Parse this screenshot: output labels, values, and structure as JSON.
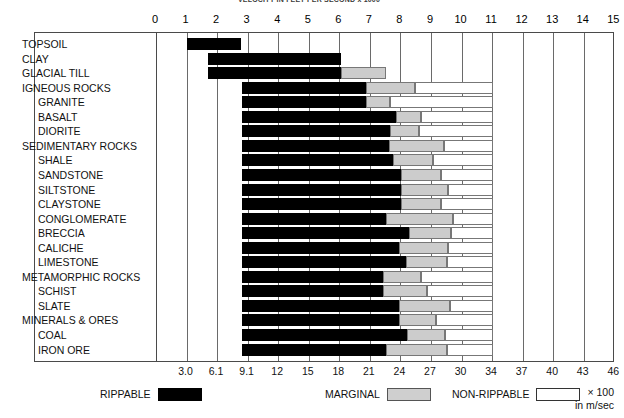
{
  "chart": {
    "title": "VELOCITY IN FEET PER SECOND x 1000",
    "top_axis": {
      "ticks": [
        "0",
        "1",
        "2",
        "3",
        "4",
        "5",
        "6",
        "7",
        "8",
        "9",
        "10",
        "11",
        "12",
        "13",
        "14",
        "15"
      ]
    },
    "bottom_axis": {
      "ticks": [
        "3.0",
        "6.1",
        "9.1",
        "12",
        "15",
        "18",
        "21",
        "24",
        "27",
        "30",
        "34",
        "37",
        "40",
        "43",
        "46"
      ]
    },
    "units": {
      "line1": "× 100",
      "line2": "in m/sec"
    }
  },
  "legend": {
    "items": [
      {
        "label": "RIPPABLE",
        "swatch": "rip"
      },
      {
        "label": "MARGINAL",
        "swatch": "mar"
      },
      {
        "label": "NON-RIPPABLE",
        "swatch": "non"
      }
    ]
  },
  "chart_data": {
    "type": "bar",
    "title": "VELOCITY IN FEET PER SECOND x 1000",
    "xlabel": "Velocity (ft/sec × 1000) / (m/sec × 100)",
    "ylabel": "",
    "xlim": [
      0,
      15
    ],
    "grid": true,
    "legend_position": "bottom",
    "series": [
      {
        "name": "RIPPABLE",
        "color": "#000000"
      },
      {
        "name": "MARGINAL",
        "color": "#cccccc"
      },
      {
        "name": "NON-RIPPABLE",
        "color": "#ffffff"
      }
    ],
    "categories": [
      "TOPSOIL",
      "CLAY",
      "GLACIAL TILL",
      "IGNEOUS ROCKS",
      "GRANITE",
      "BASALT",
      "DIORITE",
      "SEDIMENTARY ROCKS",
      "SHALE",
      "SANDSTONE",
      "SILTSTONE",
      "CLAYSTONE",
      "CONGLOMERATE",
      "BRECCIA",
      "CALICHE",
      "LIMESTONE",
      "METAMORPHIC ROCKS",
      "SCHIST",
      "SLATE",
      "MINERALS & ORES",
      "COAL",
      "IRON ORE"
    ],
    "rows": [
      {
        "label": "TOPSOIL",
        "indent": 0,
        "start": 1.05,
        "rippable_end": 2.8,
        "marginal_end": 2.8,
        "nonrippable_end": 2.8
      },
      {
        "label": "CLAY",
        "indent": 0,
        "start": 1.75,
        "rippable_end": 6.1,
        "marginal_end": 6.1,
        "nonrippable_end": 6.1
      },
      {
        "label": "GLACIAL TILL",
        "indent": 0,
        "start": 1.75,
        "rippable_end": 6.1,
        "marginal_end": 7.55,
        "nonrippable_end": 7.55
      },
      {
        "label": "IGNEOUS ROCKS",
        "indent": 0,
        "start": 2.85,
        "rippable_end": 6.9,
        "marginal_end": 8.5,
        "nonrippable_end": 11.05
      },
      {
        "label": "GRANITE",
        "indent": 1,
        "start": 2.85,
        "rippable_end": 6.9,
        "marginal_end": 7.7,
        "nonrippable_end": 11.05
      },
      {
        "label": "BASALT",
        "indent": 1,
        "start": 2.85,
        "rippable_end": 7.9,
        "marginal_end": 8.7,
        "nonrippable_end": 11.05
      },
      {
        "label": "DIORITE",
        "indent": 1,
        "start": 2.85,
        "rippable_end": 7.7,
        "marginal_end": 8.65,
        "nonrippable_end": 11.05
      },
      {
        "label": "SEDIMENTARY ROCKS",
        "indent": 0,
        "start": 2.85,
        "rippable_end": 7.65,
        "marginal_end": 9.45,
        "nonrippable_end": 11.05
      },
      {
        "label": "SHALE",
        "indent": 1,
        "start": 2.85,
        "rippable_end": 7.8,
        "marginal_end": 9.1,
        "nonrippable_end": 11.05
      },
      {
        "label": "SANDSTONE",
        "indent": 1,
        "start": 2.85,
        "rippable_end": 8.05,
        "marginal_end": 9.35,
        "nonrippable_end": 11.05
      },
      {
        "label": "SILTSTONE",
        "indent": 1,
        "start": 2.85,
        "rippable_end": 8.05,
        "marginal_end": 9.6,
        "nonrippable_end": 11.05
      },
      {
        "label": "CLAYSTONE",
        "indent": 1,
        "start": 2.85,
        "rippable_end": 8.05,
        "marginal_end": 9.35,
        "nonrippable_end": 11.05
      },
      {
        "label": "CONGLOMERATE",
        "indent": 1,
        "start": 2.85,
        "rippable_end": 7.55,
        "marginal_end": 9.75,
        "nonrippable_end": 11.05
      },
      {
        "label": "BRECCIA",
        "indent": 1,
        "start": 2.85,
        "rippable_end": 8.3,
        "marginal_end": 9.7,
        "nonrippable_end": 11.05
      },
      {
        "label": "CALICHE",
        "indent": 1,
        "start": 2.85,
        "rippable_end": 8.0,
        "marginal_end": 9.6,
        "nonrippable_end": 11.05
      },
      {
        "label": "LIMESTONE",
        "indent": 1,
        "start": 2.85,
        "rippable_end": 8.2,
        "marginal_end": 9.55,
        "nonrippable_end": 11.05
      },
      {
        "label": "METAMORPHIC ROCKS",
        "indent": 0,
        "start": 2.85,
        "rippable_end": 7.45,
        "marginal_end": 8.7,
        "nonrippable_end": 11.05
      },
      {
        "label": "SCHIST",
        "indent": 1,
        "start": 2.85,
        "rippable_end": 7.45,
        "marginal_end": 8.9,
        "nonrippable_end": 11.05
      },
      {
        "label": "SLATE",
        "indent": 1,
        "start": 2.85,
        "rippable_end": 8.0,
        "marginal_end": 9.65,
        "nonrippable_end": 11.05
      },
      {
        "label": "MINERALS & ORES",
        "indent": 0,
        "start": 2.85,
        "rippable_end": 8.0,
        "marginal_end": 9.2,
        "nonrippable_end": 11.05
      },
      {
        "label": "COAL",
        "indent": 1,
        "start": 2.85,
        "rippable_end": 8.25,
        "marginal_end": 9.5,
        "nonrippable_end": 11.05
      },
      {
        "label": "IRON ORE",
        "indent": 1,
        "start": 2.85,
        "rippable_end": 7.55,
        "marginal_end": 9.55,
        "nonrippable_end": 11.05
      }
    ]
  }
}
